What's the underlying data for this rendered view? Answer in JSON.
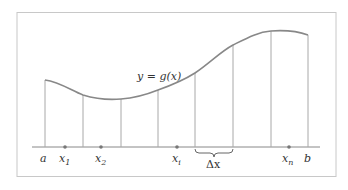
{
  "diagram": {
    "curve_label": "y = g(x)",
    "delta_label": "Δx",
    "endpoints": {
      "a": "a",
      "b": "b"
    },
    "sample_points": [
      {
        "name": "x",
        "sub": "1",
        "x": 65
      },
      {
        "name": "x",
        "sub": "2",
        "x": 101
      },
      {
        "name": "x",
        "sub": "i",
        "x": 177
      },
      {
        "name": "x",
        "sub": "n",
        "x": 289
      }
    ],
    "partition_lines": [
      {
        "x": 45,
        "y_top": 80
      },
      {
        "x": 83,
        "y_top": 95
      },
      {
        "x": 121,
        "y_top": 99
      },
      {
        "x": 158,
        "y_top": 90
      },
      {
        "x": 195,
        "y_top": 73
      },
      {
        "x": 233,
        "y_top": 45
      },
      {
        "x": 271,
        "y_top": 31
      },
      {
        "x": 308,
        "y_top": 35
      }
    ],
    "axis_y": 147,
    "colors": {
      "curve": "#888888",
      "lines": "#a8a8a8",
      "frame": "#c8c8c8",
      "dots": "#777777"
    }
  }
}
